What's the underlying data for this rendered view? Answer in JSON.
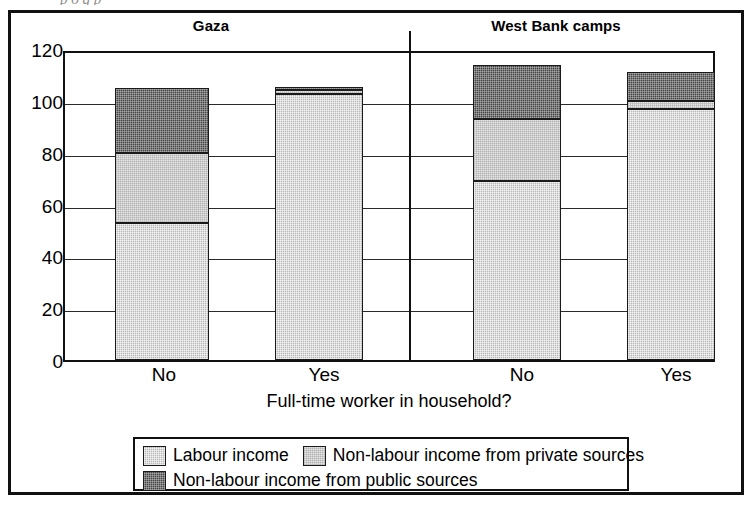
{
  "page": {
    "remnant_text": "p     o  g   p"
  },
  "chart_data": {
    "type": "bar",
    "subtype": "stacked",
    "title": "",
    "panels": [
      "Gaza",
      "West Bank camps"
    ],
    "categories": [
      "No",
      "Yes",
      "No",
      "Yes"
    ],
    "xlabel": "Full-time worker in household?",
    "ylabel": "",
    "ylim": [
      0,
      120
    ],
    "yticks": [
      0,
      20,
      40,
      60,
      80,
      100,
      120
    ],
    "ytick_labels": [
      "0",
      "20",
      "40",
      "60",
      "80",
      "100",
      "120"
    ],
    "grid": true,
    "legend_position": "bottom",
    "series": [
      {
        "name": "Labour income",
        "color": "#b9b9b9",
        "values": [
          53,
          102.5,
          69,
          97
        ]
      },
      {
        "name": "Non-labour income from private sources",
        "color": "#e6e6e6",
        "values": [
          27,
          1.5,
          24,
          3
        ]
      },
      {
        "name": "Non-labour income from public sources",
        "color": "#454545",
        "values": [
          25,
          1.5,
          21,
          11
        ]
      }
    ],
    "totals": [
      105,
      105.5,
      114,
      111
    ],
    "groups": [
      {
        "panel": "Gaza",
        "bars": [
          {
            "category": "No",
            "labour": 53,
            "private": 27,
            "public": 25,
            "total": 105
          },
          {
            "category": "Yes",
            "labour": 102.5,
            "private": 1.5,
            "public": 1.5,
            "total": 105.5
          }
        ]
      },
      {
        "panel": "West Bank camps",
        "bars": [
          {
            "category": "No",
            "labour": 69,
            "private": 24,
            "public": 21,
            "total": 114
          },
          {
            "category": "Yes",
            "labour": 97,
            "private": 3,
            "public": 11,
            "total": 111
          }
        ]
      }
    ]
  },
  "legend": {
    "items": [
      {
        "label": "Labour income",
        "color": "#b9b9b9"
      },
      {
        "label": "Non-labour income from private sources",
        "color": "#e6e6e6"
      },
      {
        "label": "Non-labour income from public sources",
        "color": "#454545"
      }
    ]
  }
}
